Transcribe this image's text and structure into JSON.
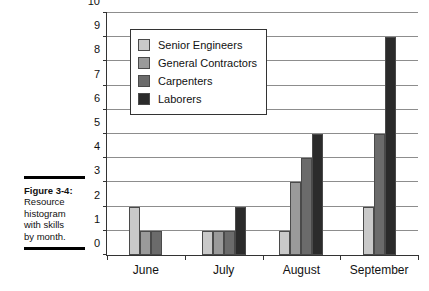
{
  "caption": {
    "figure_label": "Figure 3-4:",
    "lines": [
      "Resource",
      "histogram",
      "with skills",
      "by month."
    ]
  },
  "chart_data": {
    "type": "bar",
    "title": "",
    "xlabel": "",
    "ylabel": "",
    "categories": [
      "June",
      "July",
      "August",
      "September"
    ],
    "ylim": [
      0,
      10
    ],
    "yticks": [
      0,
      1,
      2,
      3,
      4,
      5,
      6,
      7,
      8,
      9,
      10
    ],
    "grid": true,
    "legend_position": "upper-left-inside",
    "series": [
      {
        "name": "Senior Engineers",
        "color": "#c9c9c9",
        "values": [
          2,
          1,
          1,
          2
        ]
      },
      {
        "name": "General Contractors",
        "color": "#9a9a9a",
        "values": [
          1,
          1,
          3,
          0
        ]
      },
      {
        "name": "Carpenters",
        "color": "#6b6b6b",
        "values": [
          1,
          1,
          4,
          5
        ]
      },
      {
        "name": "Laborers",
        "color": "#2b2b2b",
        "values": [
          0,
          2,
          5,
          9
        ]
      }
    ]
  }
}
